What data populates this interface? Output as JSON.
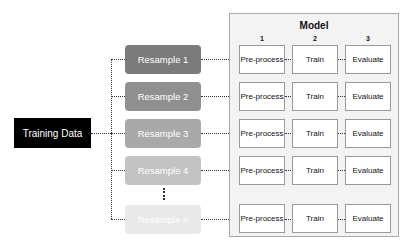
{
  "source": {
    "label": "Training Data",
    "color": "#000000",
    "text_color": "#ffffff"
  },
  "resamples": [
    {
      "label": "Resample 1",
      "color": "#7b7b7b"
    },
    {
      "label": "Resample 2",
      "color": "#8f8f8f"
    },
    {
      "label": "Resample 3",
      "color": "#a9a9a9"
    },
    {
      "label": "Resample 4",
      "color": "#c3c3c3"
    },
    {
      "label": "Resample n",
      "color": "#e9e9e9"
    }
  ],
  "ellipsis": "⋮",
  "model": {
    "title": "Model",
    "columns": [
      {
        "number": "1",
        "label": "Pre-process"
      },
      {
        "number": "2",
        "label": "Train"
      },
      {
        "number": "3",
        "label": "Evaluate"
      }
    ],
    "rows": [
      [
        "Pre-process",
        "Train",
        "Evaluate"
      ],
      [
        "Pre-process",
        "Train",
        "Evaluate"
      ],
      [
        "Pre-process",
        "Train",
        "Evaluate"
      ],
      [
        "Pre-process",
        "Train",
        "Evaluate"
      ],
      [
        "Pre-process",
        "Train",
        "Evaluate"
      ]
    ],
    "panel_color": "#f3f3f3",
    "border_color": "#a9a9a9"
  }
}
